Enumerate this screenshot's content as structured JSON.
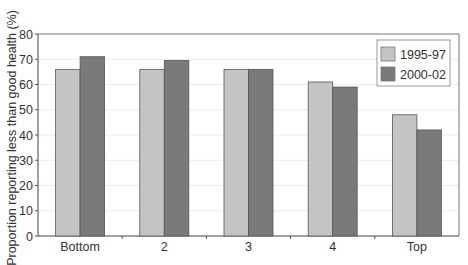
{
  "chart_data": {
    "type": "bar",
    "title": "",
    "xlabel": "",
    "ylabel": "Proportion reporting less than good health (%)",
    "ylim": [
      0,
      80
    ],
    "yticks": [
      0,
      10,
      20,
      30,
      40,
      50,
      60,
      70,
      80
    ],
    "grid": true,
    "legend_position": "top-right inside",
    "categories": [
      "Bottom",
      "2",
      "3",
      "4",
      "Top"
    ],
    "series": [
      {
        "name": "1995-97",
        "color": "#c4c4c4",
        "values": [
          66,
          66,
          66,
          61,
          48
        ]
      },
      {
        "name": "2000-02",
        "color": "#7a7a7a",
        "values": [
          71,
          69.5,
          66,
          59,
          42
        ]
      }
    ]
  }
}
